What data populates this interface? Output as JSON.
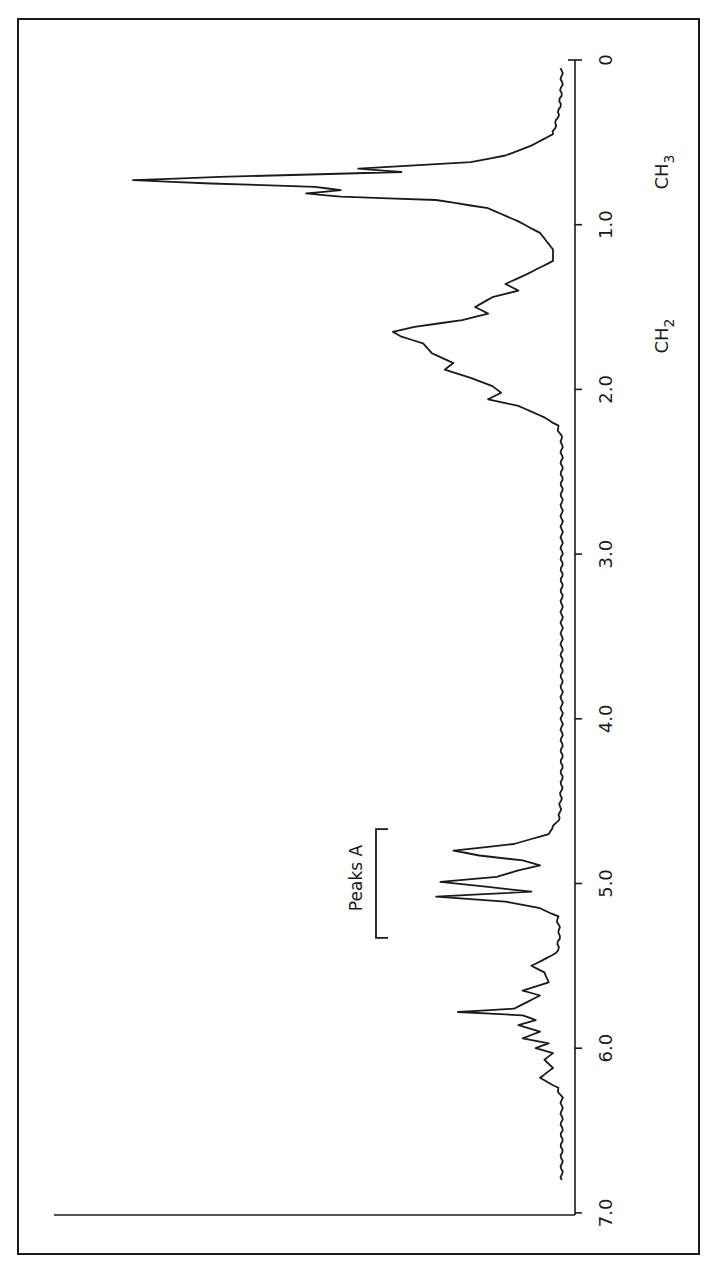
{
  "chart_data": {
    "type": "line",
    "title": "",
    "xlabel": "",
    "ylabel": "",
    "orientation": "rotated-90-clockwise",
    "axis": {
      "unit": "ppm",
      "range": [
        0,
        7.0
      ],
      "reversed": true,
      "ticks": [
        {
          "value": 0,
          "label": "0"
        },
        {
          "value": 1.0,
          "label": "1.0"
        },
        {
          "value": 2.0,
          "label": "2.0"
        },
        {
          "value": 3.0,
          "label": "3.0"
        },
        {
          "value": 4.0,
          "label": "4.0"
        },
        {
          "value": 5.0,
          "label": "5.0"
        },
        {
          "value": 6.0,
          "label": "6.0"
        },
        {
          "value": 7.0,
          "label": "7.0"
        }
      ]
    },
    "grid": false,
    "annotations": [
      {
        "label": "CH",
        "sub": "3",
        "ppm": 0.85
      },
      {
        "label": "CH",
        "sub": "2",
        "ppm": 1.7
      },
      {
        "label": "Peaks A",
        "bracket_range_ppm": [
          4.7,
          5.3
        ]
      }
    ],
    "series": [
      {
        "name": "1H NMR spectrum",
        "relative_intensity_description": "intensity 0-100 (100 = tallest peak)",
        "points": [
          [
            0.05,
            1
          ],
          [
            0.15,
            1
          ],
          [
            0.3,
            1.5
          ],
          [
            0.45,
            3
          ],
          [
            0.52,
            8
          ],
          [
            0.58,
            14
          ],
          [
            0.62,
            22
          ],
          [
            0.66,
            48
          ],
          [
            0.68,
            38
          ],
          [
            0.71,
            80
          ],
          [
            0.73,
            100
          ],
          [
            0.75,
            82
          ],
          [
            0.77,
            58
          ],
          [
            0.79,
            52
          ],
          [
            0.81,
            60
          ],
          [
            0.83,
            52
          ],
          [
            0.85,
            30
          ],
          [
            0.9,
            18
          ],
          [
            0.98,
            11
          ],
          [
            1.05,
            6
          ],
          [
            1.15,
            3
          ],
          [
            1.22,
            3
          ],
          [
            1.3,
            9
          ],
          [
            1.36,
            14
          ],
          [
            1.4,
            11
          ],
          [
            1.44,
            17
          ],
          [
            1.5,
            21
          ],
          [
            1.54,
            18
          ],
          [
            1.58,
            24
          ],
          [
            1.62,
            35
          ],
          [
            1.65,
            40
          ],
          [
            1.68,
            38
          ],
          [
            1.72,
            33
          ],
          [
            1.78,
            31
          ],
          [
            1.84,
            26
          ],
          [
            1.88,
            28
          ],
          [
            1.93,
            22
          ],
          [
            1.98,
            17
          ],
          [
            2.02,
            15
          ],
          [
            2.06,
            18
          ],
          [
            2.1,
            11
          ],
          [
            2.17,
            5
          ],
          [
            2.22,
            2
          ],
          [
            2.3,
            1
          ],
          [
            2.5,
            1
          ],
          [
            2.8,
            1
          ],
          [
            3.2,
            1
          ],
          [
            3.6,
            1
          ],
          [
            4.0,
            1
          ],
          [
            4.4,
            1
          ],
          [
            4.6,
            1.5
          ],
          [
            4.7,
            4
          ],
          [
            4.76,
            12
          ],
          [
            4.8,
            26
          ],
          [
            4.83,
            20
          ],
          [
            4.86,
            10
          ],
          [
            4.89,
            6
          ],
          [
            4.92,
            11
          ],
          [
            4.96,
            16
          ],
          [
            4.99,
            29
          ],
          [
            5.02,
            18
          ],
          [
            5.05,
            8
          ],
          [
            5.08,
            30
          ],
          [
            5.11,
            14
          ],
          [
            5.15,
            6
          ],
          [
            5.2,
            2
          ],
          [
            5.3,
            1.5
          ],
          [
            5.42,
            2
          ],
          [
            5.5,
            8
          ],
          [
            5.54,
            5
          ],
          [
            5.6,
            4
          ],
          [
            5.65,
            10
          ],
          [
            5.68,
            6
          ],
          [
            5.72,
            9
          ],
          [
            5.76,
            12
          ],
          [
            5.78,
            25
          ],
          [
            5.8,
            10
          ],
          [
            5.83,
            7
          ],
          [
            5.86,
            11
          ],
          [
            5.9,
            6
          ],
          [
            5.94,
            10
          ],
          [
            5.97,
            4
          ],
          [
            6.0,
            7
          ],
          [
            6.03,
            3
          ],
          [
            6.07,
            5
          ],
          [
            6.12,
            3
          ],
          [
            6.18,
            6
          ],
          [
            6.24,
            2
          ],
          [
            6.3,
            1
          ],
          [
            6.5,
            1
          ],
          [
            6.8,
            1
          ]
        ]
      }
    ]
  },
  "labels": {
    "ch3_main": "CH",
    "ch3_sub": "3",
    "ch2_main": "CH",
    "ch2_sub": "2",
    "peaks_a": "Peaks A",
    "tick_0": "0",
    "tick_1": "1.0",
    "tick_2": "2.0",
    "tick_3": "3.0",
    "tick_4": "4.0",
    "tick_5": "5.0",
    "tick_6": "6.0",
    "tick_7": "7.0"
  }
}
